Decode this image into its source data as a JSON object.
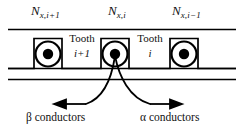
{
  "figure": {
    "type": "machine-slot-cross-section",
    "background": "#ffffff",
    "line_color": "#000000",
    "mmf_labels": [
      {
        "name": "N",
        "subscript": "x,i+1"
      },
      {
        "name": "N",
        "subscript": "x,i"
      },
      {
        "name": "N",
        "subscript": "x,i−1"
      }
    ],
    "teeth": [
      {
        "label": "Tooth",
        "index": "i+1"
      },
      {
        "label": "Tooth",
        "index": "i"
      }
    ],
    "annotations": {
      "left": "β conductors",
      "right": "α conductors"
    },
    "conductor_symbol": "current-out-of-page",
    "slot_count": 3
  }
}
